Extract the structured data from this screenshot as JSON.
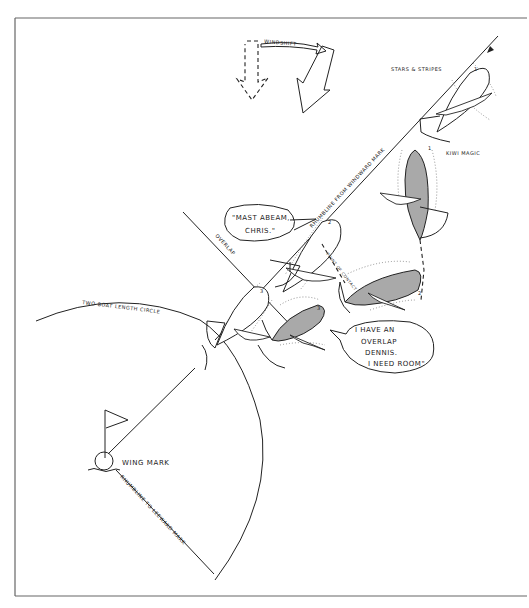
{
  "diagram": {
    "wind_shift": {
      "label": "WINDSHIFT",
      "old_wind_arrow": "dashed-down-arrow-icon",
      "new_wind_arrow": "solid-down-left-arrow-icon"
    },
    "boats": {
      "stars_and_stripes": {
        "name": "STARS & STRIPES",
        "color": "#ffffff",
        "positions": [
          "1",
          "2",
          "3"
        ]
      },
      "kiwi_magic": {
        "name": "KIWI MAGIC",
        "color": "#a9a9a9",
        "positions": [
          "1",
          "2",
          "3"
        ]
      }
    },
    "labels": {
      "rhumbline_from_windward": "RHUMBLINE FROM WINDWARD MARK",
      "rhumbline_to_leeward": "RHUMBLINE TO LEEWARD MARK",
      "overlap": "OVERLAP",
      "two_boat_length_circle": "TWO BOAT LENGTH CIRCLE",
      "wing_mark": "WING MARK",
      "point_of_contact": "POINT OF CONTACT"
    },
    "speech_bubbles": {
      "mast_abeam": [
        "\"MAST ABEAM,",
        "CHRIS.\""
      ],
      "overlap_room": [
        "I HAVE AN",
        "OVERLAP",
        "DENNIS.",
        "I NEED ROOM\""
      ]
    }
  }
}
